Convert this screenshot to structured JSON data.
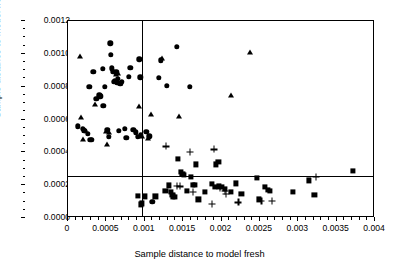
{
  "chart_data": {
    "type": "scatter",
    "title": "",
    "xlabel": "Sample distance to model fresh",
    "ylabel": "Sample distance to model frozen",
    "xlim": [
      0,
      0.004
    ],
    "ylim": [
      0,
      0.0012
    ],
    "grid": false,
    "legend": "none",
    "xticks": [
      0,
      0.0005,
      0.001,
      0.0015,
      0.002,
      0.0025,
      0.003,
      0.0035,
      0.004
    ],
    "xticklabels": [
      "0",
      "0.0005",
      "0.001",
      "0.0015",
      "0.002",
      "0.0025",
      "0.003",
      "0.0035",
      "0.004"
    ],
    "yticks": [
      0,
      0.0002,
      0.0004,
      0.0006,
      0.0008,
      0.001,
      0.0012
    ],
    "yticklabels": [
      "0.0000",
      "0.0002",
      "0.0004",
      "0.0006",
      "0.0008",
      "0.0010",
      "0.0012"
    ],
    "xminor_step": 0.0001,
    "yminor_step": 5e-05,
    "reference_lines": [
      {
        "orientation": "vertical",
        "value": 0.00096
      },
      {
        "orientation": "horizontal",
        "value": 0.000255
      }
    ],
    "series": [
      {
        "name": "circle",
        "marker": "circle",
        "points": [
          [
            0.00013,
            0.000558
          ],
          [
            0.00019,
            0.000545
          ],
          [
            0.00021,
            0.000532
          ],
          [
            0.00022,
            0.00053
          ],
          [
            0.00026,
            0.000512
          ],
          [
            0.00028,
            0.0008
          ],
          [
            0.00029,
            0.000477
          ],
          [
            0.00031,
            0.000478
          ],
          [
            0.00033,
            0.000889
          ],
          [
            0.00037,
            0.000726
          ],
          [
            0.00041,
            0.000747
          ],
          [
            0.00042,
            0.000742
          ],
          [
            0.00045,
            0.00091
          ],
          [
            0.00046,
            0.000684
          ],
          [
            0.00048,
            0.000799
          ],
          [
            0.00051,
            0.000537
          ],
          [
            0.00053,
            0.000493
          ],
          [
            0.00055,
            0.001063
          ],
          [
            0.00056,
            0.000994
          ],
          [
            0.00057,
            0.000913
          ],
          [
            0.00059,
            0.000892
          ],
          [
            0.0006,
            0.000828
          ],
          [
            0.00061,
            0.000837
          ],
          [
            0.00063,
            0.000887
          ],
          [
            0.00064,
            0.000822
          ],
          [
            0.00065,
            0.000848
          ],
          [
            0.00066,
            0.00053
          ],
          [
            0.00068,
            0.000818
          ],
          [
            0.0007,
            0.000831
          ],
          [
            0.00074,
            0.000542
          ],
          [
            0.00076,
            0.000487
          ],
          [
            0.00079,
            0.000859
          ],
          [
            0.00081,
            0.000915
          ],
          [
            0.00085,
            0.000536
          ],
          [
            0.00088,
            0.000523
          ],
          [
            0.00091,
            0.000494
          ],
          [
            0.00093,
            0.000966
          ],
          [
            0.00094,
            0.000856
          ],
          [
            0.00095,
            0.000503
          ],
          [
            0.00102,
            0.000524
          ],
          [
            0.00106,
            0.000497
          ],
          [
            0.0011,
            9.7e-05
          ],
          [
            0.00118,
            0.000855
          ],
          [
            0.00121,
            0.000961
          ],
          [
            0.00129,
            0.000806
          ],
          [
            0.00142,
            0.001043
          ],
          [
            0.00159,
            0.000799
          ]
        ]
      },
      {
        "name": "triangle",
        "marker": "triangle",
        "points": [
          [
            0.00016,
            0.000988
          ],
          [
            0.00017,
            0.000614
          ],
          [
            0.00019,
            0.000484
          ],
          [
            0.00022,
            0.000533
          ],
          [
            0.00035,
            0.000694
          ],
          [
            0.0005,
            0.000532
          ],
          [
            0.00051,
            0.000448
          ],
          [
            0.00054,
            0.000522
          ],
          [
            0.00063,
            0.000877
          ],
          [
            0.00065,
            0.000884
          ],
          [
            0.00092,
            0.000683
          ],
          [
            0.00096,
            0.000497
          ],
          [
            0.00104,
            0.000488
          ],
          [
            0.00108,
            0.000636
          ],
          [
            0.00122,
            0.000972
          ],
          [
            0.00144,
            0.000624
          ],
          [
            0.00213,
            0.000749
          ],
          [
            0.00237,
            0.001012
          ]
        ]
      },
      {
        "name": "square",
        "marker": "square",
        "points": [
          [
            0.00091,
            0.000135
          ],
          [
            0.00095,
            8.3e-05
          ],
          [
            0.00096,
            8.9e-05
          ],
          [
            0.001,
            0.000131
          ],
          [
            0.00114,
            0.000131
          ],
          [
            0.00127,
            0.000164
          ],
          [
            0.00132,
            0.000199
          ],
          [
            0.00134,
            0.000157
          ],
          [
            0.00136,
            0.000141
          ],
          [
            0.00137,
            0.000131
          ],
          [
            0.00139,
            0.000129
          ],
          [
            0.00143,
            0.000362
          ],
          [
            0.00147,
            0.000282
          ],
          [
            0.00149,
            0.000268
          ],
          [
            0.00151,
            0.000263
          ],
          [
            0.00155,
            0.000163
          ],
          [
            0.0016,
            0.000249
          ],
          [
            0.00163,
            0.000202
          ],
          [
            0.00165,
            0.0002
          ],
          [
            0.00167,
            0.000327
          ],
          [
            0.0017,
            0.000113
          ],
          [
            0.00178,
            0.000158
          ],
          [
            0.00187,
            0.000207
          ],
          [
            0.00191,
            0.000188
          ],
          [
            0.00193,
            0.000326
          ],
          [
            0.00196,
            0.00034
          ],
          [
            0.00197,
            0.000193
          ],
          [
            0.00201,
            0.000189
          ],
          [
            0.00204,
            0.000177
          ],
          [
            0.00212,
            0.000157
          ],
          [
            0.00219,
            0.000211
          ],
          [
            0.00226,
            0.000148
          ],
          [
            0.00246,
            0.000244
          ],
          [
            0.00249,
            0.000113
          ],
          [
            0.00257,
            0.000188
          ],
          [
            0.0026,
            0.000172
          ],
          [
            0.00263,
            0.000166
          ],
          [
            0.00293,
            0.000159
          ],
          [
            0.00314,
            0.000229
          ],
          [
            0.00321,
            0.00014
          ],
          [
            0.00371,
            0.000288
          ]
        ]
      },
      {
        "name": "plus",
        "marker": "plus",
        "points": [
          [
            0.00128,
            0.000436
          ],
          [
            0.00142,
            0.000196
          ],
          [
            0.00146,
            0.000193
          ],
          [
            0.00159,
            0.000405
          ],
          [
            0.00163,
            0.000161
          ],
          [
            0.00187,
            8.6e-05
          ],
          [
            0.0019,
            0.000418
          ],
          [
            0.00198,
            0.000183
          ],
          [
            0.00204,
            0.000163
          ],
          [
            0.00206,
            0.000148
          ],
          [
            0.00222,
            9.5e-05
          ],
          [
            0.00252,
            0.000105
          ],
          [
            0.00266,
            0.000105
          ],
          [
            0.00323,
            0.000249
          ]
        ]
      }
    ]
  }
}
